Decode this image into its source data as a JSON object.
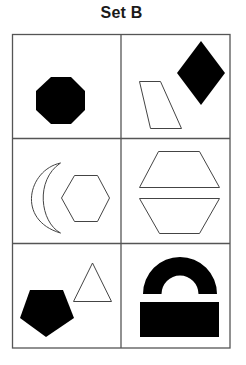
{
  "title": "Set B",
  "colors": {
    "background": "#ffffff",
    "grid_line": "#555555",
    "shape_fill": "#000000",
    "shape_outline": "#444444"
  },
  "grid": {
    "rows": 3,
    "columns": 2,
    "cells": [
      {
        "row": 1,
        "column": 1,
        "shapes": [
          {
            "type": "octagon",
            "style": "filled-black"
          }
        ]
      },
      {
        "row": 1,
        "column": 2,
        "shapes": [
          {
            "type": "parallelogram",
            "style": "outline"
          },
          {
            "type": "diamond",
            "style": "filled-black"
          }
        ]
      },
      {
        "row": 2,
        "column": 1,
        "shapes": [
          {
            "type": "crescent",
            "style": "outline"
          },
          {
            "type": "hexagon",
            "style": "outline"
          }
        ]
      },
      {
        "row": 2,
        "column": 2,
        "shapes": [
          {
            "type": "trapezoid",
            "style": "outline"
          },
          {
            "type": "inverted-trapezoid",
            "style": "outline"
          }
        ]
      },
      {
        "row": 3,
        "column": 1,
        "shapes": [
          {
            "type": "pentagon",
            "style": "filled-black"
          },
          {
            "type": "triangle",
            "style": "outline"
          }
        ]
      },
      {
        "row": 3,
        "column": 2,
        "shapes": [
          {
            "type": "arch",
            "style": "filled-black"
          },
          {
            "type": "rectangle",
            "style": "filled-black"
          }
        ]
      }
    ]
  }
}
